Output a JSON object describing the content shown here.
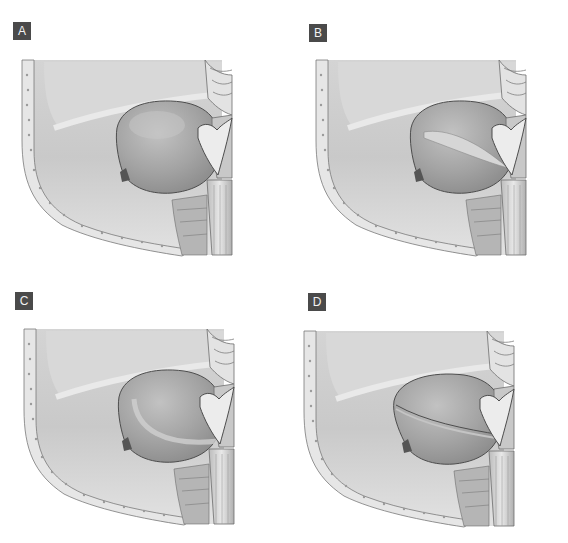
{
  "figure": {
    "panels": [
      {
        "id": "A",
        "label": "A",
        "variant": "intact-mass",
        "x": 0,
        "y": 0,
        "label_x": 13,
        "label_y": 22,
        "art_x": 22
      },
      {
        "id": "B",
        "label": "B",
        "variant": "mass-with-oblique-cleft",
        "x": 284,
        "y": 0,
        "label_x": 25,
        "label_y": 24,
        "art_x": 54
      },
      {
        "id": "C",
        "label": "C",
        "variant": "mass-with-curved-inner-margin",
        "x": 0,
        "y": 271,
        "label_x": 15,
        "label_y": 21,
        "art_x": 24
      },
      {
        "id": "D",
        "label": "D",
        "variant": "mass-split-horizontal",
        "x": 284,
        "y": 271,
        "label_x": 24,
        "label_y": 22,
        "art_x": 44
      }
    ],
    "colors": {
      "label_bg": "#4a4a4a",
      "label_text": "#f2f2f2",
      "tissue_light": "#d9d9d9",
      "tissue_mid": "#bdbdbd",
      "tissue_dark": "#8f8f8f",
      "mass": "#a9a9a9",
      "outline": "#4d4d4d",
      "bone": "#e6e6e6"
    }
  }
}
